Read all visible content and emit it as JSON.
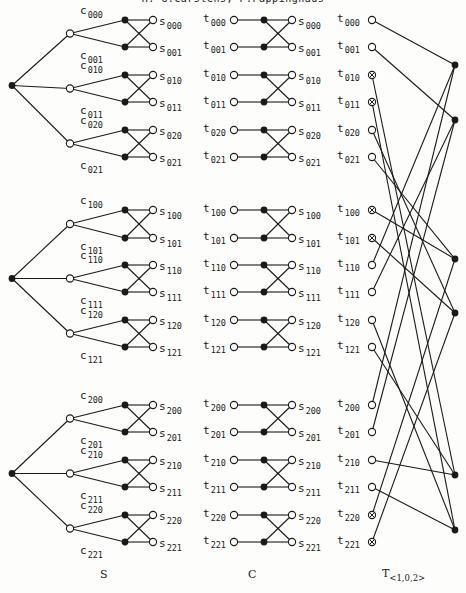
{
  "header": {
    "authors": "H.-G.Carstens, P.Päppinghaus"
  },
  "captions": {
    "S": "S",
    "C": "C",
    "T_base": "T",
    "T_sub": "<1,0,2>"
  },
  "colors": {
    "ink": "#1a1a1a",
    "paper": "#fdfdfb"
  },
  "layout": {
    "row_y": [
      [
        20,
        47,
        75,
        102,
        130,
        157
      ],
      [
        210,
        238,
        265,
        292,
        320,
        347
      ],
      [
        405,
        432,
        460,
        487,
        515,
        542
      ]
    ],
    "S": {
      "root_x": 12,
      "mid_x": 70,
      "filled_x": 125,
      "open_x": 153
    },
    "C": {
      "t_x": 234,
      "filled_x": 264,
      "s_x": 292
    },
    "T": {
      "t_x": 372,
      "filled_x": 455,
      "filled_y": [
        65,
        120,
        259,
        313,
        475,
        530
      ]
    }
  },
  "S_section": {
    "c_labels": [
      [
        "000",
        "001",
        "010",
        "011",
        "020",
        "021"
      ],
      [
        "100",
        "101",
        "110",
        "111",
        "120",
        "121"
      ],
      [
        "200",
        "201",
        "210",
        "211",
        "220",
        "221"
      ]
    ],
    "s_labels": [
      [
        "000",
        "001",
        "010",
        "011",
        "020",
        "021"
      ],
      [
        "100",
        "101",
        "110",
        "111",
        "120",
        "121"
      ],
      [
        "200",
        "201",
        "210",
        "211",
        "220",
        "221"
      ]
    ]
  },
  "C_section": {
    "t_labels": [
      [
        "000",
        "001",
        "010",
        "011",
        "020",
        "021"
      ],
      [
        "100",
        "101",
        "110",
        "111",
        "120",
        "121"
      ],
      [
        "200",
        "201",
        "210",
        "211",
        "220",
        "221"
      ]
    ],
    "s_labels": [
      [
        "000",
        "001",
        "010",
        "011",
        "020",
        "021"
      ],
      [
        "100",
        "101",
        "110",
        "111",
        "120",
        "121"
      ],
      [
        "200",
        "201",
        "210",
        "211",
        "220",
        "221"
      ]
    ]
  },
  "T_section": {
    "t_labels": [
      [
        "000",
        "001",
        "010",
        "011",
        "020",
        "021"
      ],
      [
        "100",
        "101",
        "110",
        "111",
        "120",
        "121"
      ],
      [
        "200",
        "201",
        "210",
        "211",
        "220",
        "221"
      ]
    ],
    "node_styles": [
      [
        "open",
        "open",
        "crossed",
        "crossed",
        "open",
        "open"
      ],
      [
        "crossed",
        "crossed",
        "open",
        "open",
        "open",
        "open"
      ],
      [
        "open",
        "open",
        "open",
        "open",
        "crossed",
        "crossed"
      ]
    ],
    "edges": [
      [
        0,
        0,
        0
      ],
      [
        0,
        1,
        1
      ],
      [
        0,
        2,
        4
      ],
      [
        0,
        3,
        5
      ],
      [
        0,
        4,
        3
      ],
      [
        0,
        5,
        2
      ],
      [
        1,
        0,
        2
      ],
      [
        1,
        1,
        3
      ],
      [
        1,
        2,
        0
      ],
      [
        1,
        3,
        1
      ],
      [
        1,
        4,
        5
      ],
      [
        1,
        5,
        4
      ],
      [
        2,
        0,
        0
      ],
      [
        2,
        1,
        1
      ],
      [
        2,
        2,
        4
      ],
      [
        2,
        3,
        5
      ],
      [
        2,
        4,
        2
      ],
      [
        2,
        5,
        3
      ]
    ]
  }
}
